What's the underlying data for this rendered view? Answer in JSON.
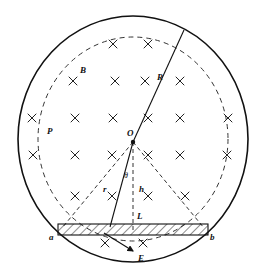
{
  "figure": {
    "title": "",
    "type": "physics-diagram",
    "canvas": {
      "width": 267,
      "height": 272,
      "background": "#ffffff"
    },
    "colors": {
      "stroke": "#111111",
      "dashed": "#333333",
      "hatch": "#222222",
      "background": "#ffffff"
    }
  },
  "labels": {
    "B": "B",
    "P": "P",
    "R": "R",
    "O": "O",
    "r": "r",
    "h": "h",
    "L": "L",
    "theta": "θ",
    "a": "a",
    "b": "b",
    "E": "E"
  },
  "geometry": {
    "outer_circle": {
      "cx": 133,
      "cy": 139,
      "rx": 115,
      "ry": 123,
      "style": "solid"
    },
    "inner_circle": {
      "cx": 133,
      "cy": 139,
      "rx": 95,
      "ry": 102,
      "style": "dashed"
    },
    "center_point": {
      "x": 133,
      "y": 142
    },
    "R_line": {
      "from": [
        133,
        142
      ],
      "to": [
        184,
        30
      ],
      "style": "solid"
    },
    "r_line": {
      "from": [
        133,
        142
      ],
      "to": [
        110,
        226
      ],
      "style": "solid"
    },
    "h_line": {
      "from": [
        133,
        142
      ],
      "to": [
        133,
        226
      ],
      "style": "dashed"
    },
    "left_ray": {
      "from": [
        133,
        142
      ],
      "to": [
        62,
        228
      ],
      "style": "dashed"
    },
    "right_ray": {
      "from": [
        133,
        142
      ],
      "to": [
        204,
        228
      ],
      "style": "dashed"
    },
    "bar": {
      "x": 58,
      "y": 224,
      "width": 150,
      "height": 11,
      "fill": "hatched"
    },
    "E_arrow": {
      "from": [
        104,
        234
      ],
      "to": [
        134,
        252
      ]
    }
  },
  "field_marks": {
    "symbol": "×",
    "meaning": "magnetic-field-into-page",
    "positions": [
      [
        113,
        44
      ],
      [
        148,
        44
      ],
      [
        73,
        81
      ],
      [
        115,
        81
      ],
      [
        145,
        81
      ],
      [
        180,
        81
      ],
      [
        32,
        118
      ],
      [
        75,
        118
      ],
      [
        113,
        118
      ],
      [
        148,
        118
      ],
      [
        180,
        118
      ],
      [
        228,
        118
      ],
      [
        33,
        155
      ],
      [
        75,
        155
      ],
      [
        112,
        155
      ],
      [
        148,
        155
      ],
      [
        180,
        155
      ],
      [
        227,
        155
      ],
      [
        75,
        196
      ],
      [
        112,
        196
      ],
      [
        148,
        196
      ],
      [
        185,
        196
      ],
      [
        105,
        243
      ],
      [
        143,
        243
      ]
    ]
  },
  "label_positions": {
    "B": [
      84,
      70
    ],
    "P": [
      51,
      131
    ],
    "R": [
      161,
      77
    ],
    "O": [
      130,
      133
    ],
    "r": [
      106,
      189
    ],
    "h": [
      141,
      189
    ],
    "L": [
      140,
      216
    ],
    "theta": [
      127,
      175
    ],
    "a": [
      52,
      238
    ],
    "b": [
      211,
      238
    ],
    "E": [
      140,
      258
    ]
  }
}
